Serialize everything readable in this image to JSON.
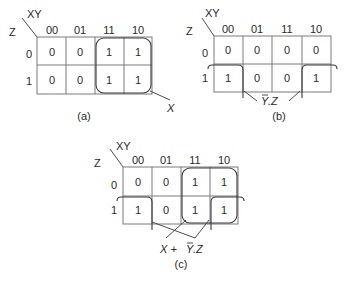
{
  "maps": {
    "a": {
      "caption": "(a)",
      "row_var": "Z",
      "col_var": "XY",
      "col_headers": [
        "00",
        "01",
        "11",
        "10"
      ],
      "row_headers": [
        "0",
        "1"
      ],
      "cells": [
        [
          "0",
          "0",
          "1",
          "1"
        ],
        [
          "0",
          "0",
          "1",
          "1"
        ]
      ],
      "groups": [
        {
          "cells": "columns 11,10 rows 0,1",
          "label": "X"
        }
      ],
      "expression": "X"
    },
    "b": {
      "caption": "(b)",
      "row_var": "Z",
      "col_var": "XY",
      "col_headers": [
        "00",
        "01",
        "11",
        "10"
      ],
      "row_headers": [
        "0",
        "1"
      ],
      "cells": [
        [
          "0",
          "0",
          "0",
          "0"
        ],
        [
          "1",
          "0",
          "0",
          "1"
        ]
      ],
      "groups": [
        {
          "cells": "row 1, columns 00 and 10 (wrap-around)",
          "label": "Y.Z",
          "overbar": "Y"
        }
      ],
      "expression_main": "Y",
      "expression_rest": ".Z"
    },
    "c": {
      "caption": "(c)",
      "row_var": "Z",
      "col_var": "XY",
      "col_headers": [
        "00",
        "01",
        "11",
        "10"
      ],
      "row_headers": [
        "0",
        "1"
      ],
      "cells": [
        [
          "0",
          "0",
          "1",
          "1"
        ],
        [
          "1",
          "0",
          "1",
          "1"
        ]
      ],
      "groups": [
        {
          "cells": "columns 11,10 rows 0,1",
          "label": "X"
        },
        {
          "cells": "row 1, columns 00 and 10 (wrap-around)",
          "label": "Y.Z",
          "overbar": "Y"
        }
      ],
      "expression_prefix": "X + ",
      "expression_main": "Y",
      "expression_rest": ".Z"
    }
  }
}
